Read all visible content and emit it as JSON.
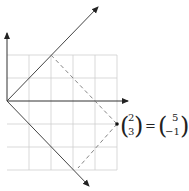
{
  "diagram": {
    "grid": {
      "color": "#c8c8c8",
      "cells_x": 5,
      "cells_y": 5
    },
    "axes": {
      "color": "#333333"
    },
    "basis_vectors": {
      "color": "#444444"
    },
    "dashed_guides": {
      "color": "#666666"
    },
    "equation": {
      "lhs": {
        "top": "2",
        "bottom": "3"
      },
      "equals": "=",
      "rhs": {
        "top": "5",
        "bottom": "−1"
      }
    }
  }
}
